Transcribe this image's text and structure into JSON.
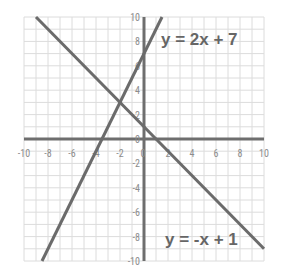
{
  "chart_data": {
    "type": "line",
    "title": "",
    "xlabel": "",
    "ylabel": "",
    "xlim": [
      -10,
      10
    ],
    "ylim": [
      -10,
      10
    ],
    "grid": true,
    "grid_step": 1,
    "x_ticks": [
      -10,
      -8,
      -6,
      -4,
      -2,
      0,
      2,
      4,
      6,
      8,
      10
    ],
    "y_ticks": [
      -10,
      -8,
      -6,
      -4,
      -2,
      0,
      2,
      4,
      6,
      8,
      10
    ],
    "x_tick_labels": [
      "-10",
      "-8",
      "-6",
      "-4",
      "-2",
      "0",
      "2",
      "4",
      "6",
      "8",
      "10"
    ],
    "y_tick_labels": [
      "-10",
      "-8",
      "-6",
      "-4",
      "-2",
      "0",
      "2",
      "4",
      "6",
      "8",
      "10"
    ],
    "series": [
      {
        "name": "y = 2x + 7",
        "slope": 2,
        "intercept": 7,
        "x": [
          -8.5,
          1.5
        ],
        "y": [
          -10,
          10
        ]
      },
      {
        "name": "y = -x + 1",
        "slope": -1,
        "intercept": 1,
        "x": [
          -9,
          10
        ],
        "y": [
          10,
          -9
        ]
      }
    ],
    "annotations": [
      {
        "text": "y = 2x + 7",
        "x": 1.3,
        "y": 8
      },
      {
        "text": "y = -x + 1",
        "x": 2,
        "y": -8.5
      }
    ],
    "intersection": {
      "x": -2,
      "y": 3
    },
    "legend": null
  },
  "labels": {
    "line1": "y = 2x + 7",
    "line2": "y = -x + 1"
  },
  "colors": {
    "grid": "#dcdcdc",
    "axis": "#6e6e6e",
    "line": "#6b6b6b",
    "text": "#666666",
    "tick": "#8c8c8c"
  }
}
